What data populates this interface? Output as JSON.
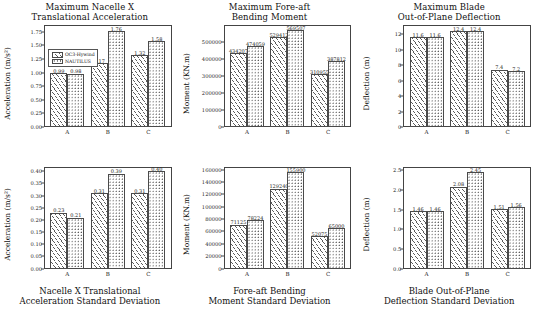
{
  "figure": {
    "legend": {
      "series": [
        {
          "name": "OC3-Hywind",
          "pattern": "diagonal-hatch"
        },
        {
          "name": "NAUTILUS",
          "pattern": "dotted-hatch"
        }
      ]
    }
  },
  "chart_data": [
    {
      "type": "bar",
      "panel": "top-left",
      "title": "Maximum Nacelle X Translational Acceleration",
      "title_lines": [
        "Maximum Nacelle X",
        "Translational Acceleration"
      ],
      "title_position": "top",
      "categories": [
        "A",
        "B",
        "C"
      ],
      "series": [
        {
          "name": "OC3-Hywind",
          "values": [
            0.99,
            1.17,
            1.32
          ]
        },
        {
          "name": "NAUTILUS",
          "values": [
            0.98,
            1.76,
            1.58
          ]
        }
      ],
      "labels": {
        "OC3-Hywind": [
          "0.99",
          "1.17",
          "1.32"
        ],
        "NAUTILUS": [
          "0.98",
          "1.76",
          "1.58"
        ]
      },
      "xlabel": "",
      "ylabel": "Acceleration (m/s²)",
      "ylim": [
        0.0,
        1.875
      ],
      "yticks": [
        0.0,
        0.25,
        0.5,
        0.75,
        1.0,
        1.25,
        1.5,
        1.75
      ],
      "ytick_labels": [
        "0.00",
        "0.25",
        "0.50",
        "0.75",
        "1.00",
        "1.25",
        "1.50",
        "1.75"
      ],
      "grid": false,
      "legend_position": "upper left"
    },
    {
      "type": "bar",
      "panel": "top-center",
      "title": "Maximum Fore-aft Bending Moment",
      "title_lines": [
        "Maximum Fore-aft",
        "Bending Moment"
      ],
      "title_position": "top",
      "categories": [
        "A",
        "B",
        "C"
      ],
      "series": [
        {
          "name": "OC3-Hywind",
          "values": [
            434207,
            529412,
            310955
          ]
        },
        {
          "name": "NAUTILUS",
          "values": [
            474059,
            569507,
            387812
          ]
        }
      ],
      "labels": {
        "OC3-Hywind": [
          "434207",
          "529412",
          "310955"
        ],
        "NAUTILUS": [
          "474059",
          "569507",
          "387812"
        ]
      },
      "xlabel": "",
      "ylabel": "Moment (KN.m)",
      "ylim": [
        0,
        600000
      ],
      "yticks": [
        0,
        100000,
        200000,
        300000,
        400000,
        500000
      ],
      "ytick_labels": [
        "0",
        "100000",
        "200000",
        "300000",
        "400000",
        "500000"
      ],
      "grid": false,
      "legend_position": "none"
    },
    {
      "type": "bar",
      "panel": "top-right",
      "title": "Maximum Blade Out-of-Plane Deflection",
      "title_lines": [
        "Maximum Blade",
        "Out-of-Plane Deflection"
      ],
      "title_position": "top",
      "categories": [
        "A",
        "B",
        "C"
      ],
      "series": [
        {
          "name": "OC3-Hywind",
          "values": [
            11.6,
            12.4,
            7.4
          ]
        },
        {
          "name": "NAUTILUS",
          "values": [
            11.6,
            12.4,
            7.2
          ]
        }
      ],
      "labels": {
        "OC3-Hywind": [
          "11.6",
          "12.4",
          "7.4"
        ],
        "NAUTILUS": [
          "11.6",
          "12.4",
          "7.2"
        ]
      },
      "xlabel": "",
      "ylabel": "Deflection (m)",
      "ylim": [
        0,
        13.2
      ],
      "yticks": [
        0,
        2,
        4,
        6,
        8,
        10,
        12
      ],
      "ytick_labels": [
        "0",
        "2",
        "4",
        "6",
        "8",
        "10",
        "12"
      ],
      "grid": false,
      "legend_position": "none"
    },
    {
      "type": "bar",
      "panel": "bottom-left",
      "title": "Nacelle X Translational Acceleration Standard Deviation",
      "title_lines": [
        "Nacelle X Translational",
        "Acceleration Standard Deviation"
      ],
      "title_position": "bottom",
      "categories": [
        "A",
        "B",
        "C"
      ],
      "series": [
        {
          "name": "OC3-Hywind",
          "values": [
            0.23,
            0.31,
            0.31
          ]
        },
        {
          "name": "NAUTILUS",
          "values": [
            0.21,
            0.39,
            0.4
          ]
        }
      ],
      "labels": {
        "OC3-Hywind": [
          "0.23",
          "0.31",
          "0.31"
        ],
        "NAUTILUS": [
          "0.21",
          "0.39",
          "0.40"
        ]
      },
      "xlabel": "",
      "ylabel": "Acceleration (m/s²)",
      "ylim": [
        0.0,
        0.42
      ],
      "yticks": [
        0.0,
        0.05,
        0.1,
        0.15,
        0.2,
        0.25,
        0.3,
        0.35,
        0.4
      ],
      "ytick_labels": [
        "0.00",
        "0.05",
        "0.10",
        "0.15",
        "0.20",
        "0.25",
        "0.30",
        "0.35",
        "0.40"
      ],
      "grid": false,
      "legend_position": "none"
    },
    {
      "type": "bar",
      "panel": "bottom-center",
      "title": "Fore-aft Bending Moment Standard Deviation",
      "title_lines": [
        "Fore-aft Bending",
        "Moment Standard Deviation"
      ],
      "title_position": "bottom",
      "categories": [
        "A",
        "B",
        "C"
      ],
      "series": [
        {
          "name": "OC3-Hywind",
          "values": [
            71125,
            129240,
            52075
          ]
        },
        {
          "name": "NAUTILUS",
          "values": [
            78224,
            155900,
            65000
          ]
        }
      ],
      "labels": {
        "OC3-Hywind": [
          "71125",
          "129240",
          "52075"
        ],
        "NAUTILUS": [
          "78224",
          "155900",
          "65000"
        ]
      },
      "xlabel": "",
      "ylabel": "Moment (KN.m)",
      "ylim": [
        0,
        165000
      ],
      "yticks": [
        0,
        20000,
        40000,
        60000,
        80000,
        100000,
        120000,
        140000,
        160000
      ],
      "ytick_labels": [
        "0",
        "20000",
        "40000",
        "60000",
        "80000",
        "100000",
        "120000",
        "140000",
        "160000"
      ],
      "grid": false,
      "legend_position": "none"
    },
    {
      "type": "bar",
      "panel": "bottom-right",
      "title": "Blade Out-of-Plane Deflection Standard Deviation",
      "title_lines": [
        "Blade Out-of-Plane",
        "Deflection Standard Deviation"
      ],
      "title_position": "bottom",
      "categories": [
        "A",
        "B",
        "C"
      ],
      "series": [
        {
          "name": "OC3-Hywind",
          "values": [
            1.46,
            2.08,
            1.51
          ]
        },
        {
          "name": "NAUTILUS",
          "values": [
            1.46,
            2.45,
            1.56
          ]
        }
      ],
      "labels": {
        "OC3-Hywind": [
          "1.46",
          "2.08",
          "1.51"
        ],
        "NAUTILUS": [
          "1.46",
          "2.45",
          "1.56"
        ]
      },
      "xlabel": "",
      "ylabel": "Deflection (m)",
      "ylim": [
        0.0,
        2.6
      ],
      "yticks": [
        0.0,
        0.5,
        1.0,
        1.5,
        2.0,
        2.5
      ],
      "ytick_labels": [
        "0.0",
        "0.5",
        "1.0",
        "1.5",
        "2.0",
        "2.5"
      ],
      "grid": false,
      "legend_position": "none"
    }
  ]
}
